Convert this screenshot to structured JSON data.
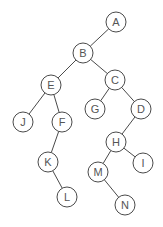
{
  "diagram": {
    "type": "binary-tree",
    "root": "A",
    "node_radius": 10,
    "nodes": [
      {
        "id": "A",
        "label": "A",
        "x": 116,
        "y": 22
      },
      {
        "id": "B",
        "label": "B",
        "x": 83,
        "y": 53
      },
      {
        "id": "E",
        "label": "E",
        "x": 51,
        "y": 85
      },
      {
        "id": "C",
        "label": "C",
        "x": 115,
        "y": 80
      },
      {
        "id": "J",
        "label": "J",
        "x": 23,
        "y": 122
      },
      {
        "id": "F",
        "label": "F",
        "x": 62,
        "y": 122
      },
      {
        "id": "G",
        "label": "G",
        "x": 95,
        "y": 109
      },
      {
        "id": "D",
        "label": "D",
        "x": 141,
        "y": 109
      },
      {
        "id": "K",
        "label": "K",
        "x": 48,
        "y": 162
      },
      {
        "id": "L",
        "label": "L",
        "x": 67,
        "y": 197
      },
      {
        "id": "H",
        "label": "H",
        "x": 116,
        "y": 142
      },
      {
        "id": "M",
        "label": "M",
        "x": 98,
        "y": 172
      },
      {
        "id": "I",
        "label": "I",
        "x": 143,
        "y": 163
      },
      {
        "id": "N",
        "label": "N",
        "x": 125,
        "y": 205
      }
    ],
    "edges": [
      {
        "from": "A",
        "to": "B"
      },
      {
        "from": "B",
        "to": "E"
      },
      {
        "from": "B",
        "to": "C"
      },
      {
        "from": "E",
        "to": "J"
      },
      {
        "from": "E",
        "to": "F"
      },
      {
        "from": "C",
        "to": "G"
      },
      {
        "from": "C",
        "to": "D"
      },
      {
        "from": "F",
        "to": "K"
      },
      {
        "from": "K",
        "to": "L"
      },
      {
        "from": "D",
        "to": "H"
      },
      {
        "from": "H",
        "to": "M"
      },
      {
        "from": "H",
        "to": "I"
      },
      {
        "from": "M",
        "to": "N"
      }
    ]
  }
}
